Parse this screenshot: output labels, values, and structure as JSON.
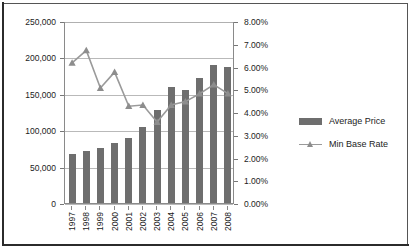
{
  "chart_data": {
    "type": "bar",
    "title": "",
    "subtitle": "",
    "xlabel": "",
    "ylabel": "",
    "categories": [
      "1997",
      "1998",
      "1999",
      "2000",
      "2001",
      "2002",
      "2003",
      "2004",
      "2005",
      "2006",
      "2007",
      "2008"
    ],
    "series": [
      {
        "name": "Average Price",
        "type": "bar",
        "axis": "left",
        "color": "#6e6e6e",
        "values": [
          68000,
          72000,
          75000,
          83000,
          90000,
          105000,
          128000,
          159000,
          155000,
          172000,
          190000,
          187000
        ]
      },
      {
        "name": "Min Base Rate",
        "type": "line",
        "axis": "right",
        "color": "#9a9a9a",
        "marker": "triangle",
        "values": [
          0.062,
          0.0675,
          0.051,
          0.058,
          0.043,
          0.0435,
          0.036,
          0.0435,
          0.045,
          0.0485,
          0.0525,
          0.0485
        ]
      }
    ],
    "left_axis": {
      "min": 0,
      "max": 250000,
      "step": 50000,
      "tick_labels": [
        "0",
        "50,000",
        "100,000",
        "150,000",
        "200,000",
        "250,000"
      ],
      "tick_values": [
        0,
        50000,
        100000,
        150000,
        200000,
        250000
      ]
    },
    "right_axis": {
      "min": 0,
      "max": 0.08,
      "step": 0.01,
      "tick_labels": [
        "0.00%",
        "1.00%",
        "2.00%",
        "3.00%",
        "4.00%",
        "5.00%",
        "6.00%",
        "7.00%",
        "8.00%"
      ],
      "tick_values": [
        0,
        0.01,
        0.02,
        0.03,
        0.04,
        0.05,
        0.06,
        0.07,
        0.08
      ]
    },
    "grid": true,
    "legend": {
      "position": "right",
      "entries": [
        {
          "label": "Average Price",
          "marker": "bar-swatch",
          "color": "#6e6e6e"
        },
        {
          "label": "Min Base  Rate",
          "marker": "line-triangle",
          "color": "#9a9a9a"
        }
      ]
    }
  },
  "colors": {
    "bar": "#6e6e6e",
    "line": "#9a9a9a",
    "grid": "#b9b9b9",
    "axis": "#8a8a8a",
    "text": "#1c1c1c",
    "frame": "#2b2b2b",
    "background": "#ffffff"
  }
}
